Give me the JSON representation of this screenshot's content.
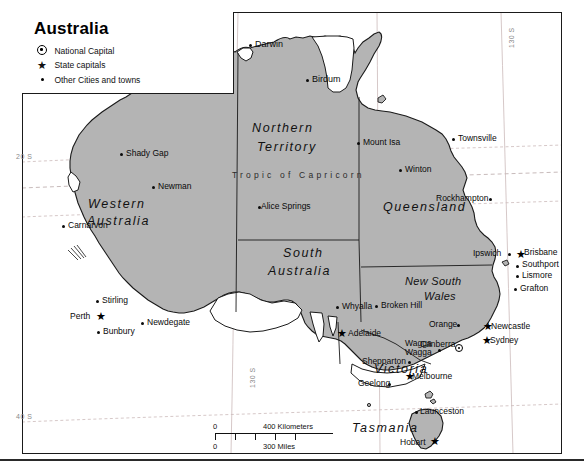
{
  "map": {
    "title": "Australia",
    "legend": {
      "items": [
        {
          "symbol": "national-capital",
          "label": "National Capital"
        },
        {
          "symbol": "state-capital",
          "label": "State capitals"
        },
        {
          "symbol": "city-dot",
          "label": "Other Cities and towns"
        }
      ]
    },
    "states": [
      {
        "name": "Western Australia",
        "line1": "Western",
        "line2": "Australia"
      },
      {
        "name": "Northern Territory",
        "line1": "Northern",
        "line2": "Territory"
      },
      {
        "name": "South Australia",
        "line1": "South",
        "line2": "Australia"
      },
      {
        "name": "Queensland",
        "line1": "Queensland",
        "line2": ""
      },
      {
        "name": "New South Wales",
        "line1": "New South",
        "line2": "Wales"
      },
      {
        "name": "Victoria",
        "line1": "Victoria",
        "line2": ""
      },
      {
        "name": "Tasmania",
        "line1": "Tasmania",
        "line2": ""
      }
    ],
    "cities": [
      {
        "name": "Darwin",
        "type": "city"
      },
      {
        "name": "Birdum",
        "type": "city"
      },
      {
        "name": "Shady Gap",
        "type": "city"
      },
      {
        "name": "Newman",
        "type": "city"
      },
      {
        "name": "Carnarvon",
        "type": "city"
      },
      {
        "name": "Mount Isa",
        "type": "city"
      },
      {
        "name": "Townsville",
        "type": "city"
      },
      {
        "name": "Winton",
        "type": "city"
      },
      {
        "name": "Rockhampton",
        "type": "city"
      },
      {
        "name": "Alice Springs",
        "type": "city"
      },
      {
        "name": "Ipswich",
        "type": "city"
      },
      {
        "name": "Brisbane",
        "type": "state-capital"
      },
      {
        "name": "Southport",
        "type": "city"
      },
      {
        "name": "Lismore",
        "type": "city"
      },
      {
        "name": "Grafton",
        "type": "city"
      },
      {
        "name": "Stirling",
        "type": "city"
      },
      {
        "name": "Perth",
        "type": "state-capital"
      },
      {
        "name": "Bunbury",
        "type": "city"
      },
      {
        "name": "Newdegate",
        "type": "city"
      },
      {
        "name": "Whyalla",
        "type": "city"
      },
      {
        "name": "Broken Hill",
        "type": "city"
      },
      {
        "name": "Adelaide",
        "type": "state-capital"
      },
      {
        "name": "Orange",
        "type": "city"
      },
      {
        "name": "Newcastle",
        "type": "state-capital"
      },
      {
        "name": "Sydney",
        "type": "state-capital"
      },
      {
        "name": "Wagga Wagga",
        "line1": "Wagga",
        "line2": "Wagga",
        "type": "city"
      },
      {
        "name": "Canberra",
        "type": "national-capital"
      },
      {
        "name": "Shepparton",
        "type": "city"
      },
      {
        "name": "Geelong",
        "type": "city"
      },
      {
        "name": "Melbourne",
        "type": "state-capital"
      },
      {
        "name": "Launceston",
        "type": "city"
      },
      {
        "name": "Hobart",
        "type": "state-capital"
      }
    ],
    "graticule": {
      "tropic_label": "Tropic  of  Capricorn",
      "lat_labels": [
        "20 S",
        "40 S"
      ],
      "lon_labels": [
        "130 S",
        "130 S"
      ]
    },
    "scale": {
      "km_zero": "0",
      "km_value": "400 Kilometers",
      "mi_zero": "0",
      "mi_value": "300 Miles"
    },
    "colors": {
      "land": "#b4b4b4",
      "water": "#ffffff",
      "outline": "#1a1a1a",
      "grid": "#c8b8b8"
    }
  }
}
